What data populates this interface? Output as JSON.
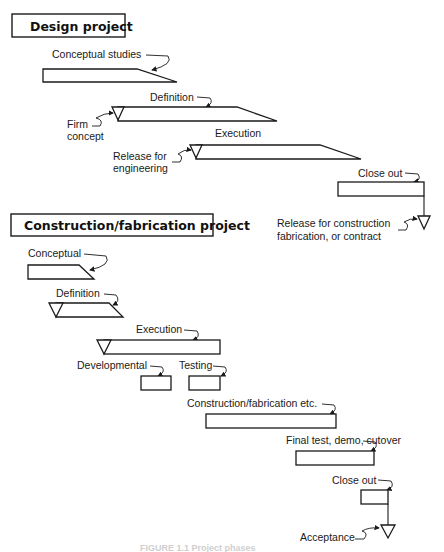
{
  "design_project": {
    "title": "Design project",
    "phases": [
      {
        "label": "Conceptual studies"
      },
      {
        "label": "Definition"
      },
      {
        "label": "Execution"
      },
      {
        "label": "Close out"
      }
    ],
    "milestones": [
      {
        "label_line1": "Firm",
        "label_line2": "concept"
      },
      {
        "label_line1": "Release for",
        "label_line2": "engineering"
      },
      {
        "label_line1": "Release for construction",
        "label_line2": "fabrication, or contract"
      }
    ]
  },
  "construction_project": {
    "title": "Construction/fabrication project",
    "phases": [
      {
        "label": "Conceptual"
      },
      {
        "label": "Definition"
      },
      {
        "label": "Execution"
      },
      {
        "label": "Developmental"
      },
      {
        "label": "Testing"
      },
      {
        "label": "Construction/fabrication etc."
      },
      {
        "label": "Final test, demo, cutover"
      },
      {
        "label": "Close out"
      }
    ],
    "milestones": [
      {
        "label": "Acceptance"
      }
    ]
  },
  "caption": "FIGURE 1.1  Project phases"
}
